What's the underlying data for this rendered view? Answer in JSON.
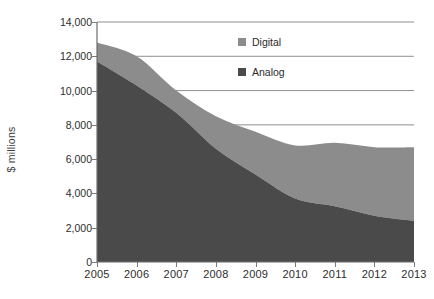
{
  "chart_data": {
    "type": "area",
    "stacked": true,
    "title": "",
    "xlabel": "",
    "ylabel": "$ millions",
    "categories": [
      "2005",
      "2006",
      "2007",
      "2008",
      "2009",
      "2010",
      "2011",
      "2012",
      "2013"
    ],
    "x": [
      2005,
      2006,
      2007,
      2008,
      2009,
      2010,
      2011,
      2012,
      2013
    ],
    "series": [
      {
        "name": "Analog",
        "color": "#4a4a4a",
        "values": [
          11700,
          10300,
          8700,
          6600,
          5100,
          3700,
          3250,
          2700,
          2400
        ]
      },
      {
        "name": "Digital",
        "color": "#8c8c8c",
        "values": [
          1100,
          1700,
          1300,
          1900,
          2500,
          3100,
          3700,
          4000,
          4300
        ]
      }
    ],
    "totals": [
      12800,
      12000,
      10000,
      8500,
      7600,
      6800,
      6950,
      6750,
      6700
    ],
    "ylim": [
      0,
      14000
    ],
    "yticks": [
      0,
      2000,
      4000,
      6000,
      8000,
      10000,
      12000,
      14000
    ],
    "ytick_labels": [
      "0",
      "2,000",
      "4,000",
      "6,000",
      "8,000",
      "10,000",
      "12,000",
      "14,000"
    ],
    "xtick_labels": [
      "2005",
      "2006",
      "2007",
      "2008",
      "2009",
      "2010",
      "2011",
      "2012",
      "2013"
    ],
    "gridlines": [
      14000,
      12000,
      10000,
      8000,
      4400
    ],
    "grid": true,
    "legend_position": "inside-top-right",
    "legend": [
      {
        "label": "Digital",
        "color": "#8c8c8c"
      },
      {
        "label": "Analog",
        "color": "#4a4a4a"
      }
    ]
  },
  "axis": {
    "y_label": "$ millions",
    "y_ticks": [
      "14,000",
      "12,000",
      "10,000",
      "8,000",
      "6,000",
      "4,000",
      "2,000",
      "0"
    ],
    "x_ticks": [
      "2005",
      "2006",
      "2007",
      "2008",
      "2009",
      "2010",
      "2011",
      "2012",
      "2013"
    ]
  },
  "legend": {
    "digital_label": "Digital",
    "analog_label": "Analog"
  },
  "colors": {
    "analog": "#4a4a4a",
    "digital": "#8c8c8c",
    "grid": "#8f8f8f",
    "axis": "#6e6e6e",
    "text": "#2d2d2d",
    "background": "#ffffff"
  }
}
